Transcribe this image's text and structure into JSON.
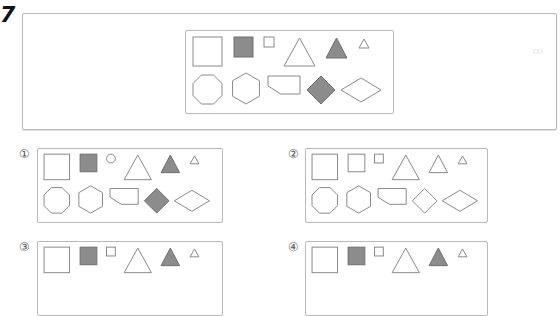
{
  "question": {
    "number": "7",
    "stimulus": {
      "row1": [
        {
          "shape": "square",
          "size": "large",
          "fill": "white"
        },
        {
          "shape": "square",
          "size": "medium",
          "fill": "gray"
        },
        {
          "shape": "square",
          "size": "small",
          "fill": "white"
        },
        {
          "shape": "triangle",
          "size": "large",
          "fill": "white"
        },
        {
          "shape": "triangle",
          "size": "medium",
          "fill": "gray"
        },
        {
          "shape": "triangle",
          "size": "small",
          "fill": "white"
        }
      ],
      "row2": [
        {
          "shape": "octagon",
          "fill": "white"
        },
        {
          "shape": "hexagon",
          "fill": "white"
        },
        {
          "shape": "pentagon",
          "fill": "white"
        },
        {
          "shape": "diamond",
          "fill": "gray"
        },
        {
          "shape": "rhombus-wide",
          "fill": "white"
        }
      ]
    },
    "corner_mark": "ꝏ",
    "options": [
      {
        "label": "①",
        "row1": [
          {
            "shape": "square",
            "size": "large",
            "fill": "white"
          },
          {
            "shape": "square",
            "size": "medium",
            "fill": "gray"
          },
          {
            "shape": "circle",
            "size": "small",
            "fill": "white"
          },
          {
            "shape": "triangle",
            "size": "large",
            "fill": "white"
          },
          {
            "shape": "triangle",
            "size": "medium",
            "fill": "gray"
          },
          {
            "shape": "triangle",
            "size": "small",
            "fill": "white"
          }
        ],
        "row2": [
          {
            "shape": "octagon",
            "fill": "white"
          },
          {
            "shape": "hexagon",
            "fill": "white"
          },
          {
            "shape": "pentagon",
            "fill": "white"
          },
          {
            "shape": "diamond",
            "fill": "gray"
          },
          {
            "shape": "rhombus-wide",
            "fill": "white"
          }
        ]
      },
      {
        "label": "②",
        "row1": [
          {
            "shape": "square",
            "size": "large",
            "fill": "white"
          },
          {
            "shape": "square",
            "size": "medium",
            "fill": "white"
          },
          {
            "shape": "square",
            "size": "small",
            "fill": "white"
          },
          {
            "shape": "triangle",
            "size": "large",
            "fill": "white"
          },
          {
            "shape": "triangle",
            "size": "medium",
            "fill": "white"
          },
          {
            "shape": "triangle",
            "size": "small",
            "fill": "white"
          }
        ],
        "row2": [
          {
            "shape": "octagon",
            "fill": "white"
          },
          {
            "shape": "hexagon",
            "fill": "white"
          },
          {
            "shape": "pentagon",
            "fill": "white"
          },
          {
            "shape": "diamond",
            "fill": "white"
          },
          {
            "shape": "rhombus-wide",
            "fill": "white"
          }
        ]
      },
      {
        "label": "③",
        "row1": [
          {
            "shape": "square",
            "size": "large",
            "fill": "white"
          },
          {
            "shape": "square",
            "size": "medium",
            "fill": "gray"
          },
          {
            "shape": "square",
            "size": "small",
            "fill": "white"
          },
          {
            "shape": "triangle",
            "size": "large",
            "fill": "white"
          },
          {
            "shape": "triangle",
            "size": "medium",
            "fill": "gray"
          },
          {
            "shape": "triangle",
            "size": "small",
            "fill": "white"
          }
        ],
        "row2": []
      },
      {
        "label": "④",
        "row1": [
          {
            "shape": "square",
            "size": "large",
            "fill": "white"
          },
          {
            "shape": "square",
            "size": "medium",
            "fill": "gray"
          },
          {
            "shape": "square",
            "size": "small",
            "fill": "white"
          },
          {
            "shape": "triangle",
            "size": "large",
            "fill": "white"
          },
          {
            "shape": "triangle",
            "size": "medium",
            "fill": "gray"
          },
          {
            "shape": "triangle",
            "size": "small",
            "fill": "white"
          }
        ],
        "row2": []
      }
    ]
  }
}
